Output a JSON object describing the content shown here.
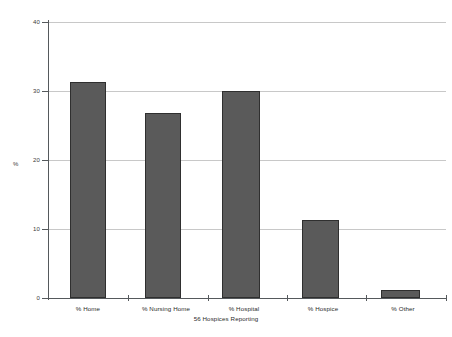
{
  "chart_data": {
    "type": "bar",
    "title": "",
    "subtitle": "",
    "categories": [
      "% Home",
      "% Nursing Home",
      "% Hospital",
      "% Hospice",
      "% Other"
    ],
    "values": [
      31.3,
      26.8,
      30.0,
      11.3,
      1.2
    ],
    "xlabel": "56 Hospices Reporting",
    "ylabel": "%",
    "ylim": [
      0,
      40
    ],
    "yticks": [
      0,
      10,
      20,
      30,
      40
    ],
    "ytick_labels": [
      "0",
      "10",
      "20",
      "30",
      "40"
    ],
    "grid": true,
    "legend": "none",
    "bar_color": "#5a5a5a",
    "bar_border_color": "#2f2f2f",
    "gridline_color": "#c8c8c8",
    "axis_color": "#55595c",
    "background_color": "#ffffff"
  },
  "axes": {
    "y_title": "%",
    "x_subtitle": "56 Hospices Reporting"
  }
}
